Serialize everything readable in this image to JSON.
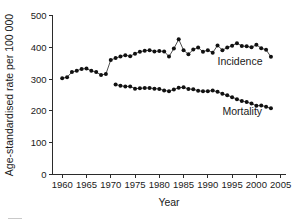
{
  "chart_data": {
    "type": "line",
    "title": "",
    "xlabel": "Year",
    "ylabel": "Age-standardised rate per 100 000",
    "xlim": [
      1958,
      2006
    ],
    "ylim": [
      0,
      500
    ],
    "xticks": [
      1960,
      1965,
      1970,
      1975,
      1980,
      1985,
      1990,
      1995,
      2000,
      2005
    ],
    "yticks": [
      0,
      100,
      200,
      300,
      400,
      500
    ],
    "grid": false,
    "legend_position": "inline-right",
    "marker": "filled-circle",
    "series": [
      {
        "name": "Incidence",
        "label_x": 1992,
        "label_y": 345,
        "x": [
          1960,
          1961,
          1962,
          1963,
          1964,
          1965,
          1966,
          1967,
          1968,
          1969,
          1970,
          1971,
          1972,
          1973,
          1974,
          1975,
          1976,
          1977,
          1978,
          1979,
          1980,
          1981,
          1982,
          1983,
          1984,
          1985,
          1986,
          1987,
          1988,
          1989,
          1990,
          1991,
          1992,
          1993,
          1994,
          1995,
          1996,
          1997,
          1998,
          1999,
          2000,
          2001,
          2002,
          2003
        ],
        "values": [
          303,
          306,
          322,
          326,
          332,
          333,
          326,
          322,
          313,
          316,
          360,
          366,
          371,
          375,
          372,
          380,
          386,
          389,
          391,
          387,
          388,
          387,
          371,
          396,
          425,
          391,
          378,
          393,
          399,
          386,
          391,
          383,
          406,
          391,
          399,
          405,
          413,
          404,
          403,
          400,
          408,
          397,
          392,
          370
        ]
      },
      {
        "name": "Mortality",
        "label_x": 1993,
        "label_y": 186,
        "x": [
          1971,
          1972,
          1973,
          1974,
          1975,
          1976,
          1977,
          1978,
          1979,
          1980,
          1981,
          1982,
          1983,
          1984,
          1985,
          1986,
          1987,
          1988,
          1989,
          1990,
          1991,
          1992,
          1993,
          1994,
          1995,
          1996,
          1997,
          1998,
          1999,
          2000,
          2001,
          2002,
          2003
        ],
        "values": [
          283,
          279,
          277,
          277,
          270,
          271,
          272,
          272,
          270,
          269,
          264,
          262,
          267,
          273,
          274,
          269,
          268,
          263,
          262,
          262,
          264,
          260,
          254,
          249,
          243,
          237,
          231,
          228,
          223,
          216,
          217,
          213,
          208
        ]
      }
    ]
  }
}
